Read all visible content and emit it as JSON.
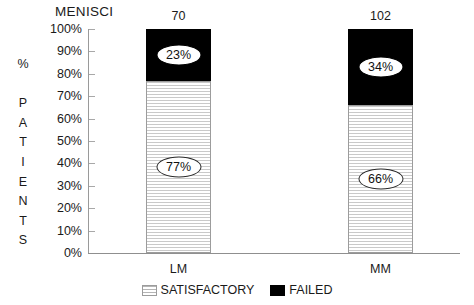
{
  "chart_data": {
    "type": "bar",
    "subtype": "stacked-percent",
    "title": "MENISCI",
    "xlabel": "",
    "ylabel": "% PATIENTS",
    "ylim": [
      0,
      100
    ],
    "grid": false,
    "legend_position": "bottom-center",
    "categories": [
      "LM",
      "MM"
    ],
    "totals": [
      "70",
      "102"
    ],
    "tick_labels": [
      "100%",
      "90%",
      "80%",
      "70%",
      "60%",
      "50%",
      "40%",
      "30%",
      "20%",
      "10%",
      "0%"
    ],
    "tick_values": [
      100,
      90,
      80,
      70,
      60,
      50,
      40,
      30,
      20,
      10,
      0
    ],
    "series": [
      {
        "name": "SATISFACTORY",
        "color": "#ffffff",
        "pattern": "horizontal-hatch",
        "values": [
          77,
          66
        ],
        "labels": [
          "77%",
          "66%"
        ]
      },
      {
        "name": "FAILED",
        "color": "#000000",
        "pattern": "solid",
        "values": [
          23,
          34
        ],
        "labels": [
          "23%",
          "34%"
        ]
      }
    ],
    "bars": [
      {
        "category": "LM",
        "total_label": "70",
        "segments": [
          {
            "series": "FAILED",
            "value": 23,
            "label": "23%"
          },
          {
            "series": "SATISFACTORY",
            "value": 77,
            "label": "77%"
          }
        ]
      },
      {
        "category": "MM",
        "total_label": "102",
        "segments": [
          {
            "series": "FAILED",
            "value": 34,
            "label": "34%"
          },
          {
            "series": "SATISFACTORY",
            "value": 66,
            "label": "66%"
          }
        ]
      }
    ]
  },
  "axis": {
    "y_label_letters": [
      "%",
      "",
      "P",
      "A",
      "T",
      "I",
      "E",
      "N",
      "T",
      "S"
    ]
  },
  "legend": {
    "items": [
      {
        "label": "SATISFACTORY",
        "swatch": "hatched-swatch"
      },
      {
        "label": "FAILED",
        "swatch": "black-swatch"
      }
    ]
  }
}
